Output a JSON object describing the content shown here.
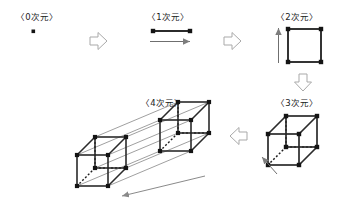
{
  "figure": {
    "title_implicit": "",
    "background_color": "#ffffff",
    "ink_color": "#1a1a1a",
    "connector_color": "#9a9a9a",
    "hidden_edge_style": "dotted"
  },
  "panels": [
    {
      "id": "dim0",
      "label": "〈0次元〉",
      "shape": "point",
      "vertices": 1,
      "edges": 0,
      "description_icon": "point-icon"
    },
    {
      "id": "dim1",
      "label": "〈1次元〉",
      "shape": "line-segment",
      "vertices": 2,
      "edges": 1,
      "description_icon": "segment-icon",
      "extrusion_arrow": "right"
    },
    {
      "id": "dim2",
      "label": "〈2次元〉",
      "shape": "square",
      "vertices": 4,
      "edges": 4,
      "description_icon": "square-icon",
      "extrusion_arrow": "up"
    },
    {
      "id": "dim3",
      "label": "〈3次元〉",
      "shape": "cube",
      "vertices": 8,
      "edges": 12,
      "description_icon": "cube-icon",
      "extrusion_arrow": "up-left"
    },
    {
      "id": "dim4",
      "label": "〈4次元〉",
      "shape": "tesseract",
      "vertices": 16,
      "edges": 32,
      "description_icon": "tesseract-icon",
      "extrusion_arrow": "down-left"
    }
  ],
  "flow_arrows": [
    {
      "id": "arrow-0-to-1",
      "direction": "right",
      "icon": "block-arrow-right-icon"
    },
    {
      "id": "arrow-1-to-2",
      "direction": "right",
      "icon": "block-arrow-right-icon"
    },
    {
      "id": "arrow-2-to-3",
      "direction": "down",
      "icon": "block-arrow-down-icon"
    },
    {
      "id": "arrow-3-to-4",
      "direction": "left",
      "icon": "block-arrow-left-icon"
    }
  ]
}
